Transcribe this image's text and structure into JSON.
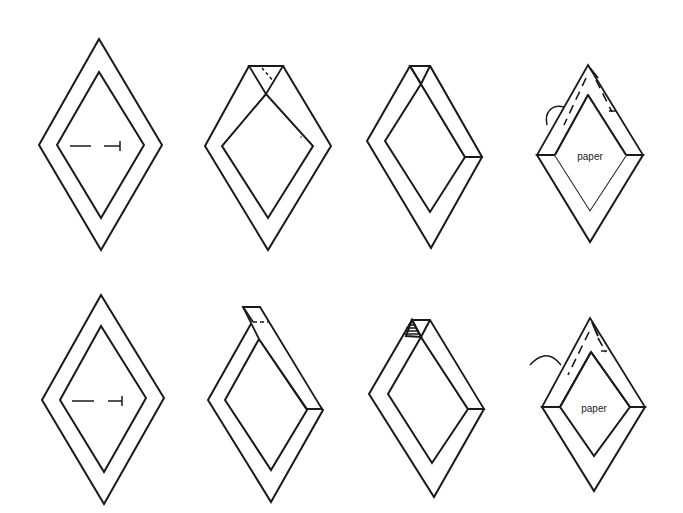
{
  "colors": {
    "ink": "#1a1a1a",
    "background": "#ffffff"
  },
  "hatch": {
    "pattern": "vertical-lines",
    "spacing": 4
  },
  "rows": [
    {
      "name": "row-1",
      "steps": [
        {
          "step": 1,
          "description": "flat diamond frame with cut line",
          "outer": "99,39 162,145 101,250 39,145",
          "inner": "99,72 144,145 101,218 57,145",
          "cut": {
            "x1": 70,
            "x2": 120,
            "y": 146
          }
        },
        {
          "step": 2,
          "description": "top corner folded, notch",
          "label": ""
        },
        {
          "step": 3,
          "description": "right top edge folded over"
        },
        {
          "step": 4,
          "description": "paper inserted, stitched",
          "label": "paper"
        }
      ]
    },
    {
      "name": "row-2",
      "steps": [
        {
          "step": 5,
          "description": "flat diamond frame with cut line"
        },
        {
          "step": 6,
          "description": "tab extended at top, right edge folded"
        },
        {
          "step": 7,
          "description": "right edge folded, top triangle hatched"
        },
        {
          "step": 8,
          "description": "paper inserted, stitched",
          "label": "paper"
        }
      ]
    }
  ],
  "labels": {
    "paper_top": "paper",
    "paper_bottom": "paper"
  }
}
